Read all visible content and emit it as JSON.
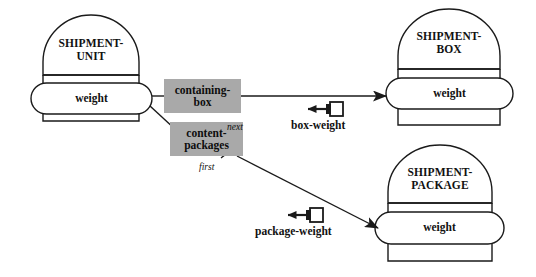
{
  "diagram": {
    "background_color": "#ffffff",
    "line_color": "#1a1a1a",
    "role_box_fill": "#a9a9a9"
  },
  "entities": [
    {
      "id": "shipment-unit",
      "name": "SHIPMENT-\nUNIT",
      "attribute": "weight"
    },
    {
      "id": "shipment-box",
      "name": "SHIPMENT-\nBOX",
      "attribute": "weight"
    },
    {
      "id": "shipment-package",
      "name": "SHIPMENT-\nPACKAGE",
      "attribute": "weight"
    }
  ],
  "roles": [
    {
      "id": "containing-box",
      "label": "containing-\nbox"
    },
    {
      "id": "content-packages",
      "label": "content-\npackages"
    }
  ],
  "ordering": [
    {
      "id": "next",
      "label": "next"
    },
    {
      "id": "first",
      "label": "first"
    }
  ],
  "operations": [
    {
      "id": "box-weight",
      "label": "box-weight"
    },
    {
      "id": "package-weight",
      "label": "package-weight"
    }
  ]
}
